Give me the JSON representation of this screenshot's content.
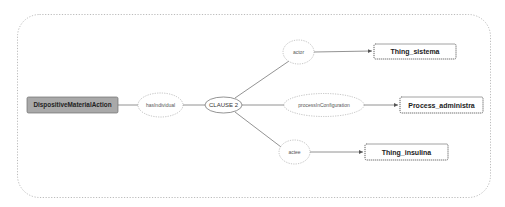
{
  "diagram": {
    "type": "semantic-graph",
    "colors": {
      "background": "#ffffff",
      "boundary": "#aaaaaa",
      "edge": "#777777",
      "root_fill": "#a9a9a9",
      "root_stroke": "#6f6f6f",
      "ellipse_stroke": "#999999",
      "clause_stroke": "#666666",
      "target_stroke": "#444444"
    },
    "root": {
      "label": "DispositiveMaterialAction"
    },
    "relation": {
      "label": "hasIndividual"
    },
    "clause": {
      "label": "CLAUSE 2"
    },
    "roles": [
      {
        "label": "actor",
        "target": "Thing_sistema"
      },
      {
        "label": "processInConfiguration",
        "target": "Process_administra"
      },
      {
        "label": "actee",
        "target": "Thing_insulina"
      }
    ],
    "edges": [
      {
        "from": "DispositiveMaterialAction",
        "to": "hasIndividual",
        "arrow": false
      },
      {
        "from": "hasIndividual",
        "to": "CLAUSE 2",
        "arrow": false
      },
      {
        "from": "CLAUSE 2",
        "to": "actor",
        "arrow": false
      },
      {
        "from": "CLAUSE 2",
        "to": "processInConfiguration",
        "arrow": false
      },
      {
        "from": "CLAUSE 2",
        "to": "actee",
        "arrow": false
      },
      {
        "from": "actor",
        "to": "Thing_sistema",
        "arrow": true
      },
      {
        "from": "processInConfiguration",
        "to": "Process_administra",
        "arrow": true
      },
      {
        "from": "actee",
        "to": "Thing_insulina",
        "arrow": true
      }
    ]
  }
}
